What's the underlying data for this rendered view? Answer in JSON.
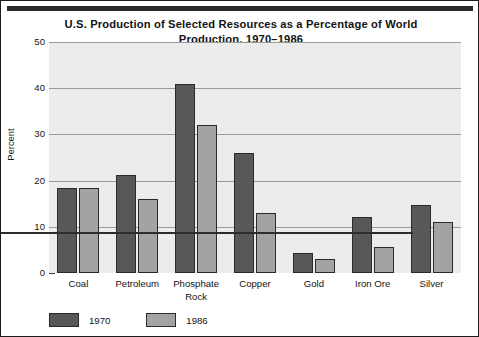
{
  "chart_data": {
    "type": "bar",
    "title": "U.S. Production of Selected Resources as a Percentage of World Production, 1970–1986",
    "title_line_1": "U.S. Production of Selected Resources as a Percentage of World",
    "title_line_2": "Production, 1970–1986",
    "xlabel": "",
    "ylabel": "Percent",
    "ylim": [
      0,
      50
    ],
    "ytick_labels": [
      "50",
      "40",
      "30",
      "20",
      "10",
      "0"
    ],
    "ytick_values": [
      50,
      40,
      30,
      20,
      10,
      0
    ],
    "grid": "horizontal",
    "legend_position": "below-axis-left",
    "categories": [
      "Coal",
      "Petroleum",
      "Phosphate Rock",
      "Copper",
      "Gold",
      "Iron Ore",
      "Silver"
    ],
    "category_lines": [
      [
        "Coal"
      ],
      [
        "Petroleum"
      ],
      [
        "Phosphate",
        "Rock"
      ],
      [
        "Copper"
      ],
      [
        "Gold"
      ],
      [
        "Iron Ore"
      ],
      [
        "Silver"
      ]
    ],
    "series": [
      {
        "name": "1970",
        "color": "#585858",
        "values": [
          18.5,
          21.2,
          41.0,
          26.0,
          4.4,
          12.2,
          14.8
        ]
      },
      {
        "name": "1986",
        "color": "#a3a3a3",
        "values": [
          18.5,
          16.0,
          32.0,
          13.0,
          3.0,
          5.6,
          11.0
        ]
      }
    ]
  },
  "colors": {
    "series_1970": "#585858",
    "series_1986": "#a3a3a3",
    "plot_background": "#ececec",
    "gridline": "#9a9a9a",
    "axis": "#2d2d2d",
    "frame_border": "#1c1c1c",
    "top_rule": "#2b2b2b",
    "text": "#121212"
  }
}
